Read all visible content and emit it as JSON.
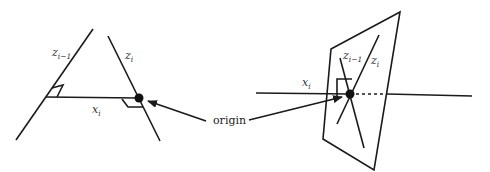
{
  "diagram": {
    "left": {
      "labels": {
        "z_prev": {
          "base": "z",
          "sub": "i−1"
        },
        "z_curr": {
          "base": "z",
          "sub": "i"
        },
        "x_curr": {
          "base": "x",
          "sub": "i"
        }
      }
    },
    "right": {
      "labels": {
        "z_prev": {
          "base": "z",
          "sub": "i−1"
        },
        "z_curr": {
          "base": "z",
          "sub": "i"
        },
        "x_curr": {
          "base": "x",
          "sub": "i"
        }
      }
    },
    "annotation": {
      "text": "origin"
    },
    "colors": {
      "stroke": "#1a1a1a",
      "text": "#333333",
      "background": "#ffffff"
    }
  }
}
